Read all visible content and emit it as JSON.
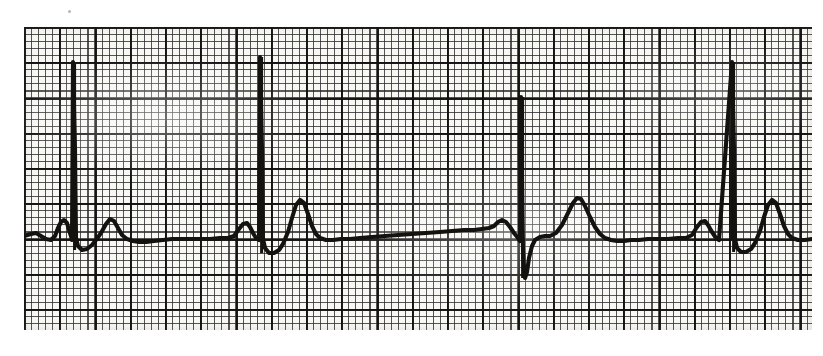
{
  "document": {
    "kind": "scanned-ecg-rhythm-strip",
    "title": "ECG Rhythm Strip",
    "background_color": "#ffffff",
    "paper_color": "#f7f7f4",
    "ink_color": "#14120f",
    "grid_color": "#282626",
    "grid_bold_color": "#100e0e",
    "visible_text": "",
    "labels": [],
    "annotations": []
  },
  "paper": {
    "x": 24,
    "y": 27,
    "width": 788,
    "height": 303,
    "small_square_px": 7.05,
    "bold_square_px": 35.25,
    "squares_across": 112,
    "squares_down": 43,
    "bold_blocks_across": 22,
    "bold_blocks_down": 8
  },
  "chart_data": {
    "type": "line",
    "title": "ECG Rhythm Strip",
    "subtitle": "",
    "xlabel": "",
    "ylabel": "",
    "grid": true,
    "legend_position": "none",
    "tick_labels_x": [],
    "tick_labels_y": [],
    "xlim": [
      24,
      812
    ],
    "ylim": [
      330,
      27
    ],
    "baseline_y": 238,
    "series": [
      {
        "name": "ECG lead trace",
        "stroke": "#14120f",
        "points": [
          [
            24,
            236
          ],
          [
            31,
            234
          ],
          [
            36,
            233
          ],
          [
            41,
            236
          ],
          [
            46,
            239
          ],
          [
            51,
            240
          ],
          [
            55,
            236
          ],
          [
            58,
            228
          ],
          [
            61,
            222
          ],
          [
            64,
            220
          ],
          [
            67,
            223
          ],
          [
            69,
            230
          ],
          [
            71,
            236
          ],
          [
            72,
            240
          ],
          [
            73,
            62
          ],
          [
            75,
            150
          ],
          [
            76,
            238
          ],
          [
            78,
            246
          ],
          [
            82,
            250
          ],
          [
            87,
            249
          ],
          [
            92,
            245
          ],
          [
            96,
            240
          ],
          [
            101,
            233
          ],
          [
            106,
            224
          ],
          [
            110,
            219
          ],
          [
            114,
            221
          ],
          [
            118,
            228
          ],
          [
            122,
            235
          ],
          [
            127,
            239
          ],
          [
            133,
            241
          ],
          [
            139,
            242
          ],
          [
            146,
            242
          ],
          [
            154,
            241
          ],
          [
            163,
            240
          ],
          [
            172,
            239
          ],
          [
            181,
            239
          ],
          [
            190,
            239
          ],
          [
            200,
            239
          ],
          [
            210,
            239
          ],
          [
            220,
            238
          ],
          [
            228,
            238
          ],
          [
            234,
            236
          ],
          [
            239,
            229
          ],
          [
            243,
            224
          ],
          [
            247,
            223
          ],
          [
            250,
            227
          ],
          [
            253,
            233
          ],
          [
            256,
            238
          ],
          [
            259,
            240
          ],
          [
            260,
            57
          ],
          [
            262,
            150
          ],
          [
            263,
            239
          ],
          [
            265,
            248
          ],
          [
            269,
            253
          ],
          [
            274,
            253
          ],
          [
            279,
            250
          ],
          [
            283,
            244
          ],
          [
            288,
            232
          ],
          [
            292,
            218
          ],
          [
            296,
            205
          ],
          [
            300,
            200
          ],
          [
            304,
            203
          ],
          [
            308,
            214
          ],
          [
            312,
            226
          ],
          [
            316,
            234
          ],
          [
            320,
            238
          ],
          [
            326,
            240
          ],
          [
            333,
            240
          ],
          [
            341,
            239
          ],
          [
            350,
            239
          ],
          [
            360,
            238
          ],
          [
            372,
            237
          ],
          [
            385,
            236
          ],
          [
            398,
            235
          ],
          [
            412,
            234
          ],
          [
            426,
            233
          ],
          [
            440,
            232
          ],
          [
            452,
            231
          ],
          [
            464,
            230
          ],
          [
            474,
            230
          ],
          [
            482,
            229
          ],
          [
            489,
            228
          ],
          [
            494,
            226
          ],
          [
            498,
            222
          ],
          [
            502,
            220
          ],
          [
            506,
            222
          ],
          [
            510,
            227
          ],
          [
            514,
            233
          ],
          [
            518,
            238
          ],
          [
            520,
            241
          ],
          [
            521,
            97
          ],
          [
            522,
            180
          ],
          [
            523,
            250
          ],
          [
            524,
            270
          ],
          [
            525,
            278
          ],
          [
            527,
            272
          ],
          [
            529,
            258
          ],
          [
            532,
            246
          ],
          [
            535,
            240
          ],
          [
            540,
            237
          ],
          [
            545,
            236
          ],
          [
            550,
            236
          ],
          [
            556,
            233
          ],
          [
            562,
            225
          ],
          [
            568,
            213
          ],
          [
            573,
            203
          ],
          [
            577,
            198
          ],
          [
            581,
            199
          ],
          [
            585,
            206
          ],
          [
            590,
            217
          ],
          [
            595,
            227
          ],
          [
            600,
            234
          ],
          [
            605,
            238
          ],
          [
            611,
            240
          ],
          [
            617,
            241
          ],
          [
            624,
            241
          ],
          [
            631,
            240
          ],
          [
            639,
            240
          ],
          [
            648,
            239
          ],
          [
            658,
            239
          ],
          [
            668,
            239
          ],
          [
            678,
            238
          ],
          [
            686,
            238
          ],
          [
            692,
            235
          ],
          [
            697,
            227
          ],
          [
            701,
            222
          ],
          [
            705,
            221
          ],
          [
            708,
            225
          ],
          [
            712,
            232
          ],
          [
            716,
            238
          ],
          [
            719,
            240
          ],
          [
            732,
            62
          ],
          [
            734,
            150
          ],
          [
            735,
            239
          ],
          [
            737,
            248
          ],
          [
            741,
            252
          ],
          [
            746,
            252
          ],
          [
            751,
            249
          ],
          [
            755,
            243
          ],
          [
            760,
            231
          ],
          [
            764,
            217
          ],
          [
            768,
            205
          ],
          [
            772,
            200
          ],
          [
            776,
            203
          ],
          [
            780,
            214
          ],
          [
            784,
            226
          ],
          [
            788,
            234
          ],
          [
            792,
            238
          ],
          [
            798,
            240
          ],
          [
            805,
            240
          ],
          [
            812,
            239
          ]
        ]
      }
    ],
    "qrs_complexes": [
      {
        "index": 1,
        "r_peak_x": 73,
        "r_peak_y": 62,
        "r_amplitude_px": 176,
        "has_s_wave": false,
        "s_nadir_y": 250,
        "t_peak_x": 110,
        "t_peak_y": 219,
        "p_peak_x": 64,
        "p_peak_y": 220
      },
      {
        "index": 2,
        "r_peak_x": 260,
        "r_peak_y": 57,
        "r_amplitude_px": 181,
        "has_s_wave": false,
        "s_nadir_y": 253,
        "t_peak_x": 300,
        "t_peak_y": 200,
        "p_peak_x": 247,
        "p_peak_y": 223
      },
      {
        "index": 3,
        "r_peak_x": 521,
        "r_peak_y": 97,
        "r_amplitude_px": 141,
        "has_s_wave": true,
        "s_nadir_y": 278,
        "t_peak_x": 577,
        "t_peak_y": 198,
        "p_peak_x": 498,
        "p_peak_y": 222
      },
      {
        "index": 4,
        "r_peak_x": 732,
        "r_peak_y": 62,
        "r_amplitude_px": 176,
        "has_s_wave": false,
        "s_nadir_y": 252,
        "t_peak_x": 772,
        "t_peak_y": 200,
        "p_peak_x": 705,
        "p_peak_y": 221
      }
    ],
    "rr_intervals_px": [
      187,
      261,
      211
    ],
    "annotations": []
  },
  "specks": [
    {
      "x": 68,
      "y": 10,
      "size": 3
    },
    {
      "x": 215,
      "y": 128,
      "size": 2
    },
    {
      "x": 660,
      "y": 70,
      "size": 2
    },
    {
      "x": 352,
      "y": 158,
      "size": 2
    },
    {
      "x": 505,
      "y": 62,
      "size": 2
    }
  ]
}
